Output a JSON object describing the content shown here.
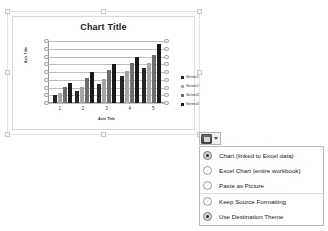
{
  "chart_object": {
    "name": "chart-placeholder",
    "title": "Chart Title",
    "x_axis_title": "Axis Title",
    "y_axis_title": "Axis Title"
  },
  "chart_data": {
    "type": "bar",
    "title": "Chart Title",
    "xlabel": "Axis Title",
    "ylabel": "Axis Title",
    "categories": [
      "1",
      "2",
      "3",
      "4",
      "5"
    ],
    "ylim": [
      0,
      8
    ],
    "yticks": [
      "0",
      "1",
      "2",
      "3",
      "4",
      "5",
      "6",
      "7",
      "8"
    ],
    "grid": true,
    "legend_position": "right",
    "series": [
      {
        "name": "Series1",
        "color": "#262626",
        "values": [
          1,
          1.5,
          2.5,
          3.5,
          4.5
        ]
      },
      {
        "name": "Series2",
        "color": "#a6a6a6",
        "values": [
          1.3,
          2.1,
          3.1,
          4.1,
          5.1
        ]
      },
      {
        "name": "Series3",
        "color": "#6e6e6e",
        "values": [
          2.1,
          3.2,
          4.2,
          5.2,
          6.2
        ]
      },
      {
        "name": "Series4",
        "color": "#1a1a1a",
        "values": [
          2.6,
          4.0,
          5.0,
          6.0,
          7.6
        ]
      }
    ]
  },
  "paste_button": {
    "icon": "clipboard-icon",
    "caret": "chevron-down-icon",
    "tooltip": "Paste Options"
  },
  "paste_menu": {
    "items": [
      {
        "label": "Chart (linked to Excel data)",
        "selected": true,
        "separator_above": false
      },
      {
        "label": "Excel Chart (entire workbook)",
        "selected": false,
        "separator_above": false
      },
      {
        "label": "Paste as Picture",
        "selected": false,
        "separator_above": false
      },
      {
        "label": "Keep Source Formatting",
        "selected": false,
        "separator_above": true
      },
      {
        "label": "Use Destination Theme",
        "selected": true,
        "separator_above": false
      }
    ]
  }
}
